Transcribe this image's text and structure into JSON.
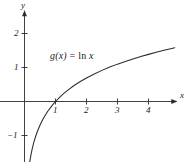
{
  "figure": {
    "background_color": "#ffffff",
    "stroke_color": "#2b2b2b",
    "axis_color": "#2b2b2b"
  },
  "annotations": {
    "function_label_g": "g(x)",
    "function_label_eq": " = ",
    "function_label_ln": "ln",
    "function_label_arg": " x",
    "function_label_full": "g(x) = ln x"
  },
  "axes": {
    "x_axis_label": "x",
    "y_axis_label": "y",
    "x_ticks": [
      "1",
      "2",
      "3",
      "4"
    ],
    "y_ticks": [
      "2",
      "1",
      "−1"
    ]
  },
  "chart_data": {
    "type": "line",
    "title": "",
    "xlabel": "x",
    "ylabel": "y",
    "xlim": [
      -0.15,
      5.3
    ],
    "ylim": [
      -2.0,
      2.6
    ],
    "grid": false,
    "legend": "none",
    "annotations": [
      {
        "text": "g(x) = ln x",
        "x": 0.85,
        "y": 1.35
      }
    ],
    "xticks": [
      1,
      2,
      3,
      4
    ],
    "xticklabels": [
      "1",
      "2",
      "3",
      "4"
    ],
    "yticks": [
      2,
      1,
      -1
    ],
    "yticklabels": [
      "2",
      "1",
      "−1"
    ],
    "series": [
      {
        "name": "g(x) = ln x",
        "function": "ln(x)",
        "color": "#2b2b2b",
        "x": [
          0.155,
          0.18,
          0.21,
          0.25,
          0.3,
          0.36,
          0.43,
          0.52,
          0.62,
          0.75,
          0.9,
          1.0,
          1.1,
          1.25,
          1.4,
          1.6,
          1.8,
          2.0,
          2.25,
          2.5,
          2.75,
          3.0,
          3.25,
          3.5,
          3.75,
          4.0,
          4.25,
          4.5,
          4.75,
          4.85
        ],
        "y": [
          -1.864,
          -1.715,
          -1.561,
          -1.386,
          -1.204,
          -1.022,
          -0.844,
          -0.654,
          -0.478,
          -0.288,
          -0.105,
          0.0,
          0.095,
          0.223,
          0.336,
          0.47,
          0.588,
          0.693,
          0.811,
          0.916,
          1.012,
          1.099,
          1.179,
          1.253,
          1.322,
          1.386,
          1.447,
          1.504,
          1.558,
          1.579
        ]
      }
    ]
  }
}
